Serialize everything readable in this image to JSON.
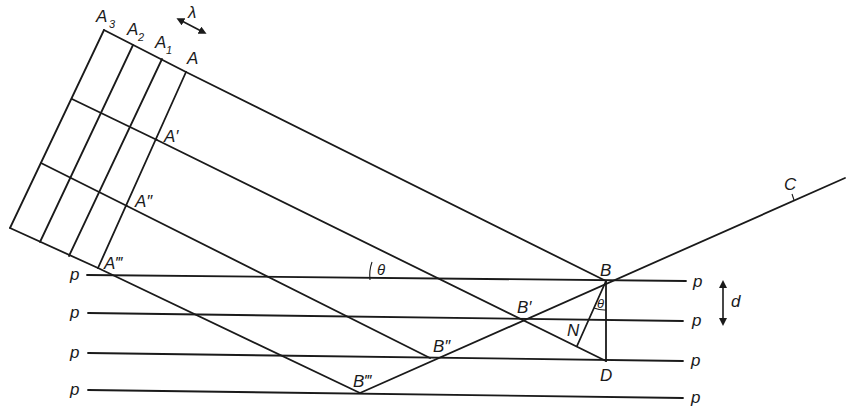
{
  "figure": {
    "labels": {
      "A3": "A",
      "A3_sub": "3",
      "A2": "A",
      "A2_sub": "2",
      "A1": "A",
      "A1_sub": "1",
      "A": "A",
      "A_prime": "A′",
      "A_dprime": "A″",
      "A_tprime": "A‴",
      "lambda": "λ",
      "theta_left": "θ",
      "theta_right": "θ",
      "B": "B",
      "B_prime": "B′",
      "B_dprime": "B″",
      "B_tprime": "B‴",
      "N": "N",
      "D": "D",
      "C": "C",
      "d": "d"
    },
    "planes": {
      "label": "p",
      "count": 4
    },
    "colors": {
      "ink": "#1a1a1a",
      "background": "#ffffff"
    }
  }
}
